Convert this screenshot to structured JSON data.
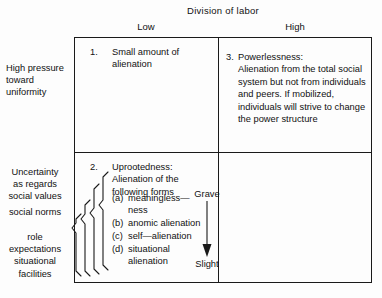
{
  "figure": {
    "top_axis_title": "Division of labor",
    "column_headers": [
      "Low",
      "High"
    ],
    "row_labels": {
      "top": "High pressure\ntoward\nuniformity",
      "top_line1": "High pressure",
      "top_line2": "toward",
      "top_line3": "uniformity",
      "bottom_group1_line1": "Uncertainty",
      "bottom_group1_line2": "as regards",
      "bottom_group1_line3": "social values",
      "bottom_group2": "social norms",
      "bottom_group3_line1": "role",
      "bottom_group3_line2": "expectations",
      "bottom_group3_line3": "situational",
      "bottom_group3_line4": "facilities"
    },
    "quadrants": [
      {
        "number": "1.",
        "title": "",
        "text": "Small amount of alienation"
      },
      {
        "number": "3.",
        "title": "Powerlessness:",
        "text": "Alienation from the total social system but not from individuals and peers. If mobilized, individuals will strive to change the power structure"
      },
      {
        "number": "2.",
        "title": "Uprootedness:",
        "text": "Alienation of the following forms"
      },
      {
        "number": "4.",
        "title": "",
        "text": "Small amount of alienation"
      }
    ],
    "subforms": [
      {
        "tag": "(a)",
        "text": "meaningless—ness"
      },
      {
        "tag": "(b)",
        "text": "anomic alienation"
      },
      {
        "tag": "(c)",
        "text": "self—alienation"
      },
      {
        "tag": "(d)",
        "text": "situational alienation"
      }
    ],
    "severity_scale": {
      "top_label": "Grave",
      "bottom_label": "Slight"
    },
    "colors": {
      "ink": "#111111",
      "border": "#1a1a1a",
      "background": "#fdfdfd"
    }
  }
}
